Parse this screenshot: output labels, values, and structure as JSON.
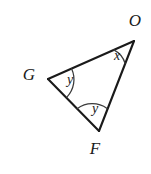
{
  "figure": {
    "kind": "geometry-triangle-diagram",
    "background_color": "#ffffff",
    "stroke_color": "#1a1a1a",
    "arc_color": "#3a3a3a",
    "width": 151,
    "height": 174,
    "vertices": [
      {
        "id": "O",
        "label": "O",
        "x": 134,
        "y": 41,
        "label_x": 135,
        "label_y": 22
      },
      {
        "id": "G",
        "label": "G",
        "x": 48,
        "y": 79,
        "label_x": 29,
        "label_y": 76
      },
      {
        "id": "F",
        "label": "F",
        "x": 99,
        "y": 131,
        "label_x": 95,
        "label_y": 150
      }
    ],
    "sides": [
      {
        "id": "side-GO",
        "from": "G",
        "to": "O",
        "d": "M 48 79 L 134 41"
      },
      {
        "id": "side-OF",
        "from": "O",
        "to": "F",
        "d": "M 134 41 L 99 131"
      },
      {
        "id": "side-FG",
        "from": "F",
        "to": "G",
        "d": "M 99 131 L 48 79"
      }
    ],
    "angles": [
      {
        "id": "angle-O",
        "at_vertex": "O",
        "label": "x",
        "label_x": 117,
        "label_y": 57,
        "arc_d": "M 113.8 49.9 A 23 23 0 0 1 125.1 63.2"
      },
      {
        "id": "angle-G",
        "at_vertex": "G",
        "label": "y",
        "label_x": 70,
        "label_y": 81,
        "arc_d": "M 71.6 68.8 A 25.5 25.5 0 0 1 66.9 97.1"
      },
      {
        "id": "angle-F",
        "at_vertex": "F",
        "label": "y",
        "label_x": 95,
        "label_y": 110,
        "arc_d": "M 77.1 108.7 A 25.5 25.5 0 0 1 107.1 108.4"
      }
    ]
  }
}
